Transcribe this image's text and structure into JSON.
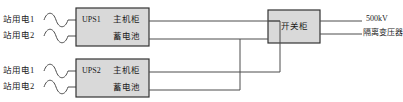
{
  "diagram": {
    "colors": {
      "box_fill": "#d9d9d9",
      "box_stroke": "#333333",
      "line": "#4d4d4d",
      "text": "#1a1a1a",
      "background": "#ffffff"
    },
    "sources": [
      {
        "id": "ups1-src1",
        "label": "站用电1",
        "symbol": "sine-wave"
      },
      {
        "id": "ups1-src2",
        "label": "站用电2",
        "symbol": "sine-wave"
      },
      {
        "id": "ups2-src1",
        "label": "站用电1",
        "symbol": "sine-wave"
      },
      {
        "id": "ups2-src2",
        "label": "站用电2",
        "symbol": "sine-wave"
      }
    ],
    "ups_units": [
      {
        "tag": "UPS1",
        "rows": [
          "主机柜",
          "蓄电池"
        ]
      },
      {
        "tag": "UPS2",
        "rows": [
          "主机柜",
          "蓄电池"
        ]
      }
    ],
    "switchgear": {
      "label": "开关柜"
    },
    "outputs": [
      {
        "label": "500kV"
      },
      {
        "label": "隔离变压器"
      }
    ]
  }
}
